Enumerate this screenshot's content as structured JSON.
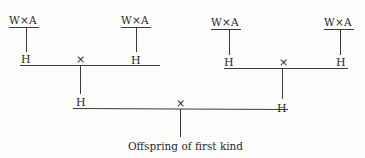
{
  "diagram": {
    "type": "pedigree / crossing scheme",
    "parents": [
      {
        "label": "W×A"
      },
      {
        "label": "W×A"
      },
      {
        "label": "W×A"
      },
      {
        "label": "W×A"
      }
    ],
    "hybrids_level1": [
      {
        "label": "H"
      },
      {
        "label": "H"
      },
      {
        "label": "H"
      },
      {
        "label": "H"
      }
    ],
    "cross_symbol": "×",
    "hybrids_level2": [
      {
        "label": "H"
      },
      {
        "label": "H"
      }
    ],
    "crosses": [
      "×",
      "×",
      "×"
    ],
    "result": "Offspring of first kind"
  },
  "colors": {
    "ink": "#2a2a2a",
    "paper": "#fcfcfa"
  }
}
